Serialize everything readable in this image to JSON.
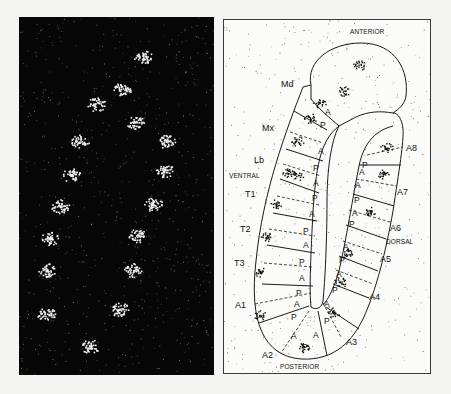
{
  "figure": {
    "left_panel": {
      "description": "dark-field in situ hybridization micrograph of segmented embryo",
      "background_color": "#070707",
      "signal_color": "#f2f2f2",
      "stripe_spots": [
        {
          "x": 143,
          "y": 57
        },
        {
          "x": 122,
          "y": 88
        },
        {
          "x": 96,
          "y": 104
        },
        {
          "x": 135,
          "y": 122
        },
        {
          "x": 80,
          "y": 141
        },
        {
          "x": 166,
          "y": 141
        },
        {
          "x": 71,
          "y": 175
        },
        {
          "x": 164,
          "y": 170
        },
        {
          "x": 60,
          "y": 206
        },
        {
          "x": 153,
          "y": 204
        },
        {
          "x": 50,
          "y": 238
        },
        {
          "x": 137,
          "y": 235
        },
        {
          "x": 46,
          "y": 270
        },
        {
          "x": 133,
          "y": 270
        },
        {
          "x": 46,
          "y": 314
        },
        {
          "x": 119,
          "y": 309
        },
        {
          "x": 90,
          "y": 346
        }
      ]
    },
    "right_panel": {
      "description": "schematic tracing of embryo with segment boundaries",
      "orientation": {
        "anterior": "ANTERIOR",
        "posterior": "POSTERIOR",
        "ventral": "VENTRAL",
        "dorsal": "DORSAL"
      },
      "ventral_segments": [
        "Md",
        "Mx",
        "Lb",
        "T1",
        "T2",
        "T3",
        "A1",
        "A2"
      ],
      "dorsal_segments": [
        "A3",
        "A4",
        "A5",
        "A6",
        "A7",
        "A8"
      ],
      "compartments": {
        "anterior": "A",
        "posterior": "P"
      },
      "line_color": "#1a1a1a",
      "stipple_color": "#2a2a2a"
    }
  }
}
